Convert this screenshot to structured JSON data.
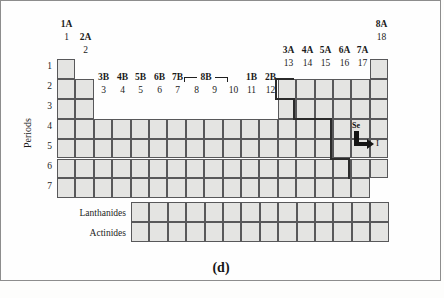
{
  "figure": {
    "panel_label": "(d)",
    "axis_title_periods": "Periods",
    "series_labels": {
      "lanthanides": "Lanthanides",
      "actinides": "Actinides"
    }
  },
  "group_labels_top": [
    {
      "id": "g1",
      "text": "1A"
    },
    {
      "id": "g2",
      "text": "2A"
    },
    {
      "id": "g3",
      "text": "3B"
    },
    {
      "id": "g4",
      "text": "4B"
    },
    {
      "id": "g5",
      "text": "5B"
    },
    {
      "id": "g6",
      "text": "6B"
    },
    {
      "id": "g7",
      "text": "7B"
    },
    {
      "id": "g8",
      "text": "8B"
    },
    {
      "id": "g11",
      "text": "1B"
    },
    {
      "id": "g12",
      "text": "2B"
    },
    {
      "id": "g13",
      "text": "3A"
    },
    {
      "id": "g14",
      "text": "4A"
    },
    {
      "id": "g15",
      "text": "5A"
    },
    {
      "id": "g16",
      "text": "6A"
    },
    {
      "id": "g17",
      "text": "7A"
    },
    {
      "id": "g18",
      "text": "8A"
    }
  ],
  "group_numbers": [
    {
      "id": "n1",
      "text": "1"
    },
    {
      "id": "n2",
      "text": "2"
    },
    {
      "id": "n3",
      "text": "3"
    },
    {
      "id": "n4",
      "text": "4"
    },
    {
      "id": "n5",
      "text": "5"
    },
    {
      "id": "n6",
      "text": "6"
    },
    {
      "id": "n7",
      "text": "7"
    },
    {
      "id": "n8",
      "text": "8"
    },
    {
      "id": "n9",
      "text": "9"
    },
    {
      "id": "n10",
      "text": "10"
    },
    {
      "id": "n11",
      "text": "11"
    },
    {
      "id": "n12",
      "text": "12"
    },
    {
      "id": "n13",
      "text": "13"
    },
    {
      "id": "n14",
      "text": "14"
    },
    {
      "id": "n15",
      "text": "15"
    },
    {
      "id": "n16",
      "text": "16"
    },
    {
      "id": "n17",
      "text": "17"
    },
    {
      "id": "n18",
      "text": "18"
    }
  ],
  "period_numbers": [
    {
      "id": "p1",
      "text": "1"
    },
    {
      "id": "p2",
      "text": "2"
    },
    {
      "id": "p3",
      "text": "3"
    },
    {
      "id": "p4",
      "text": "4"
    },
    {
      "id": "p5",
      "text": "5"
    },
    {
      "id": "p6",
      "text": "6"
    },
    {
      "id": "p7",
      "text": "7"
    }
  ],
  "annotations": {
    "from_element": "Se",
    "to_element": "I",
    "arrow": "L-shaped arrow from Se down then right to I"
  },
  "colors": {
    "cell_fill": "#e4e4e2",
    "cell_stroke": "#58585a",
    "stair_stroke": "#2b2b2b",
    "text": "#1b1b1b",
    "background": "#fefefe",
    "frame": "#8d8d8d"
  },
  "chart_data": {
    "type": "table",
    "grid": {
      "columns": 18,
      "rows": 7,
      "cell_width_px": 18.4,
      "cell_height_px": 19.9,
      "origin_x_px": 57,
      "origin_y_px": 59
    },
    "main_block_occupancy": [
      {
        "period": 1,
        "groups": [
          1,
          18
        ]
      },
      {
        "period": 2,
        "groups": [
          1,
          2,
          13,
          14,
          15,
          16,
          17,
          18
        ]
      },
      {
        "period": 3,
        "groups": [
          1,
          2,
          13,
          14,
          15,
          16,
          17,
          18
        ]
      },
      {
        "period": 4,
        "groups": [
          1,
          2,
          3,
          4,
          5,
          6,
          7,
          8,
          9,
          10,
          11,
          12,
          13,
          14,
          15,
          16,
          17,
          18
        ]
      },
      {
        "period": 5,
        "groups": [
          1,
          2,
          3,
          4,
          5,
          6,
          7,
          8,
          9,
          10,
          11,
          12,
          13,
          14,
          15,
          16,
          17,
          18
        ]
      },
      {
        "period": 6,
        "groups": [
          1,
          2,
          3,
          4,
          5,
          6,
          7,
          8,
          9,
          10,
          11,
          12,
          13,
          14,
          15,
          16,
          17,
          18
        ]
      },
      {
        "period": 7,
        "groups": [
          1,
          2,
          3,
          4,
          5,
          6,
          7,
          8,
          9,
          10,
          11,
          12,
          13,
          14,
          15,
          16,
          17
        ]
      }
    ],
    "f_block": {
      "rows": [
        "Lanthanides",
        "Actinides"
      ],
      "columns": 14
    },
    "metalloid_staircase": "bold stepped line between groups 12/13 at period 2 down through group 16/17 at period 6",
    "highlighted_elements": [
      "Se",
      "I"
    ]
  }
}
